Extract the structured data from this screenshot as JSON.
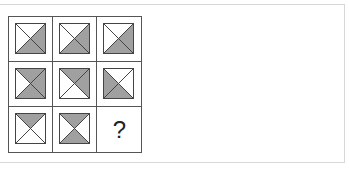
{
  "puzzle": {
    "shade_color": "#a0a0a0",
    "line_color": "#444444",
    "cells": [
      {
        "row": 0,
        "col": 0,
        "shaded": [
          "right",
          "bottom"
        ]
      },
      {
        "row": 0,
        "col": 1,
        "shaded": [
          "right",
          "bottom"
        ]
      },
      {
        "row": 0,
        "col": 2,
        "shaded": [
          "right",
          "bottom"
        ]
      },
      {
        "row": 1,
        "col": 0,
        "shaded": [
          "top",
          "right",
          "bottom"
        ]
      },
      {
        "row": 1,
        "col": 1,
        "shaded": [
          "top",
          "right"
        ]
      },
      {
        "row": 1,
        "col": 2,
        "shaded": [
          "left",
          "bottom"
        ]
      },
      {
        "row": 2,
        "col": 0,
        "shaded": [
          "top"
        ]
      },
      {
        "row": 2,
        "col": 1,
        "shaded": [
          "top",
          "bottom"
        ]
      },
      {
        "row": 2,
        "col": 2,
        "unknown": true,
        "label": "?"
      }
    ]
  }
}
